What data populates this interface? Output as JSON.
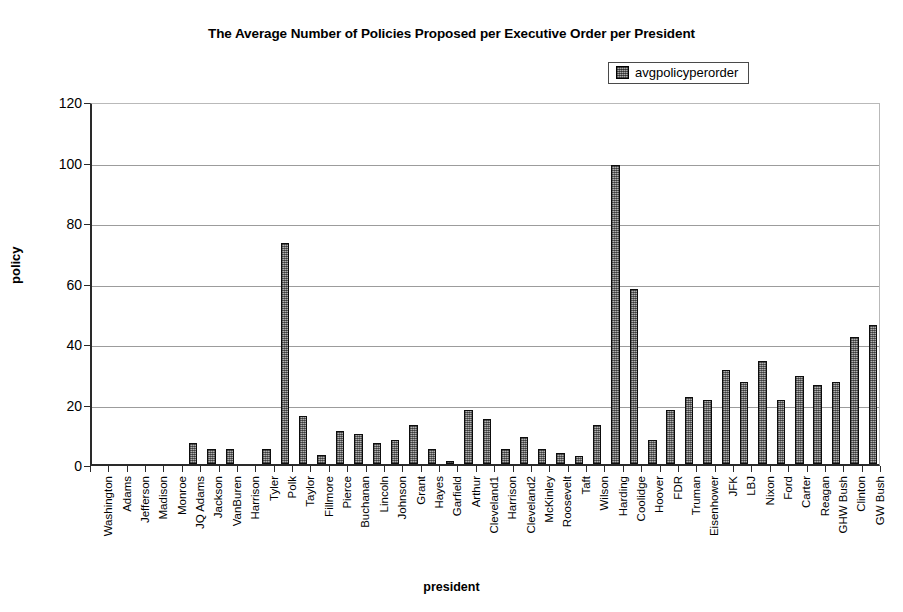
{
  "chart_data": {
    "type": "bar",
    "title": "The Average Number of Policies Proposed per Executive Order per President",
    "xlabel": "president",
    "ylabel": "policy",
    "ylim": [
      0,
      120
    ],
    "yticks": [
      0,
      20,
      40,
      60,
      80,
      100,
      120
    ],
    "grid": "horizontal",
    "legend_position": "top-right",
    "legend": [
      "avgpolicyperorder"
    ],
    "series_name": "avgpolicyperorder",
    "bar_color": "#b0b0b0",
    "bar_edge_color": "#0d0d0d",
    "categories": [
      "Washington",
      "Adams",
      "Jefferson",
      "Madison",
      "Monroe",
      "JQ Adams",
      "Jackson",
      "VanBuren",
      "Harrison",
      "Tyler",
      "Polk",
      "Taylor",
      "Fillmore",
      "Pierce",
      "Buchanan",
      "Lincoln",
      "Johnson",
      "Grant",
      "Hayes",
      "Garfield",
      "Arthur",
      "Cleveland1",
      "Harrison",
      "Cleveland2",
      "McKinley",
      "Roosevelt",
      "Taft",
      "Wilson",
      "Harding",
      "Coolidge",
      "Hoover",
      "FDR",
      "Truman",
      "Eisenhower",
      "JFK",
      "LBJ",
      "Nixon",
      "Ford",
      "Carter",
      "Reagan",
      "GHW Bush",
      "Clinton",
      "GW Bush"
    ],
    "values": [
      0,
      0,
      0,
      0,
      0,
      7,
      5,
      5,
      0,
      5,
      73,
      16,
      3,
      11,
      10,
      7,
      8,
      13,
      5,
      1,
      18,
      15,
      5,
      9,
      5,
      3.5,
      2.5,
      13,
      99,
      58,
      8,
      18,
      22,
      21,
      31,
      27,
      34,
      21,
      29,
      26,
      27,
      42,
      46
    ]
  }
}
